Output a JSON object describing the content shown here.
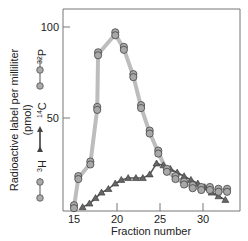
{
  "chart_data": {
    "type": "line",
    "title": "",
    "xlabel": "Fraction number",
    "ylabel": "Radioactive label per milliliter (pmol)",
    "xlim": [
      14.5,
      34
    ],
    "ylim": [
      0,
      107
    ],
    "xticks": [
      15,
      20,
      25,
      30
    ],
    "yticks": [
      50,
      100
    ],
    "grid": false,
    "legend_position": "left, rotated vertical",
    "legend": [
      {
        "name": "32P",
        "label_base": "",
        "label_sup": "32",
        "label_el": "P",
        "marker": "circle",
        "color": "#a8a8a8"
      },
      {
        "name": "14C",
        "label_sup": "14",
        "label_el": "C",
        "marker": "triangle",
        "color": "#555555"
      },
      {
        "name": "3H",
        "label_sup": "3",
        "label_el": "H",
        "marker": "circle",
        "color": "#a8a8a8"
      }
    ],
    "series": [
      {
        "name": "32P / 3H",
        "marker": "circle",
        "x": [
          15,
          15.5,
          16.9,
          17.7,
          17.8,
          19.8,
          20.8,
          21.9,
          22.8,
          23.8,
          24.8,
          25.8,
          26.8,
          27.8,
          28.8,
          29.8,
          30.8,
          31.8,
          32.8
        ],
        "values": [
          1,
          17,
          25,
          55,
          85,
          96,
          88,
          73,
          56,
          42,
          31,
          21,
          17,
          14,
          12,
          11,
          11,
          10,
          10
        ]
      },
      {
        "name": "14C",
        "marker": "triangle",
        "x": [
          16,
          16.8,
          17.5,
          18.2,
          19,
          19.8,
          20.5,
          21.3,
          22.2,
          23,
          23.8,
          24.6,
          25.4,
          26.2,
          27,
          27.8,
          28.6,
          29.4,
          30.2,
          31,
          31.8,
          32.6
        ],
        "values": [
          1,
          3,
          6,
          9,
          11,
          14,
          16,
          17,
          17,
          17,
          19,
          25,
          24,
          22,
          20,
          18,
          16,
          14,
          12,
          9,
          7,
          5
        ]
      }
    ],
    "axis_labels": {
      "y_line1": "Radioactive label per milliliter",
      "y_line2": "(pmol)"
    }
  }
}
